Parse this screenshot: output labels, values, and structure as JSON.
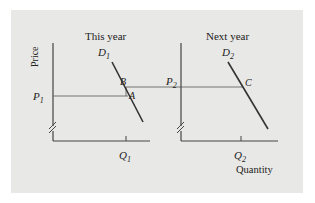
{
  "diagram": {
    "left_panel": {
      "title": "This year",
      "y_axis_label": "Price",
      "demand_label": "D",
      "demand_sub": "1",
      "price_label": "P",
      "price_sub": "1",
      "quantity_label": "Q",
      "quantity_sub": "1",
      "point_a": "A",
      "point_b": "B"
    },
    "right_panel": {
      "title": "Next year",
      "demand_label": "D",
      "demand_sub": "2",
      "price_label": "P",
      "price_sub": "2",
      "quantity_label": "Q",
      "quantity_sub": "2",
      "point_c": "C",
      "x_axis_label": "Quantity"
    },
    "colors": {
      "background": "#e8e8e6",
      "axis": "#444444",
      "demand_line": "#333333",
      "guide_line": "#666666"
    }
  }
}
